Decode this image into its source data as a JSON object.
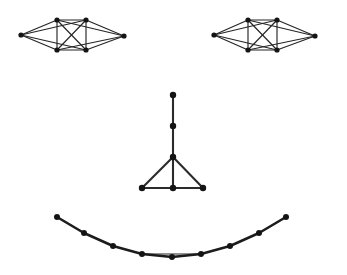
{
  "figure": {
    "background_color": "#ffffff",
    "width": 347,
    "height": 275,
    "edge_color": "#252525",
    "node_color": "#141414"
  },
  "components": [
    {
      "id": "left-eye",
      "name": "left-eye-graph",
      "description": "Six-node dense eye-shaped graph (left)",
      "node_radius": 2.6,
      "edge_width": 1.15,
      "nodes": [
        {
          "id": "L0",
          "label": "left-apex",
          "x": 21,
          "y": 35
        },
        {
          "id": "L1",
          "label": "top-left",
          "x": 57,
          "y": 20
        },
        {
          "id": "L2",
          "label": "top-right",
          "x": 86,
          "y": 20
        },
        {
          "id": "L3",
          "label": "right-apex",
          "x": 124,
          "y": 36
        },
        {
          "id": "L4",
          "label": "bottom-right",
          "x": 86,
          "y": 50
        },
        {
          "id": "L5",
          "label": "bottom-left",
          "x": 57,
          "y": 50
        }
      ],
      "edges": [
        [
          "L0",
          "L1"
        ],
        [
          "L0",
          "L2"
        ],
        [
          "L0",
          "L4"
        ],
        [
          "L0",
          "L5"
        ],
        [
          "L1",
          "L2"
        ],
        [
          "L1",
          "L3"
        ],
        [
          "L1",
          "L4"
        ],
        [
          "L1",
          "L5"
        ],
        [
          "L2",
          "L3"
        ],
        [
          "L2",
          "L4"
        ],
        [
          "L2",
          "L5"
        ],
        [
          "L3",
          "L4"
        ],
        [
          "L3",
          "L5"
        ],
        [
          "L4",
          "L5"
        ]
      ]
    },
    {
      "id": "right-eye",
      "name": "right-eye-graph",
      "description": "Six-node dense eye-shaped graph (right)",
      "node_radius": 2.6,
      "edge_width": 1.15,
      "nodes": [
        {
          "id": "R0",
          "label": "left-apex",
          "x": 214,
          "y": 35
        },
        {
          "id": "R1",
          "label": "top-left",
          "x": 248,
          "y": 20
        },
        {
          "id": "R2",
          "label": "top-right",
          "x": 277,
          "y": 20
        },
        {
          "id": "R3",
          "label": "right-apex",
          "x": 315,
          "y": 36
        },
        {
          "id": "R4",
          "label": "bottom-right",
          "x": 277,
          "y": 50
        },
        {
          "id": "R5",
          "label": "bottom-left",
          "x": 248,
          "y": 50
        }
      ],
      "edges": [
        [
          "R0",
          "R1"
        ],
        [
          "R0",
          "R2"
        ],
        [
          "R0",
          "R4"
        ],
        [
          "R0",
          "R5"
        ],
        [
          "R1",
          "R2"
        ],
        [
          "R1",
          "R3"
        ],
        [
          "R1",
          "R4"
        ],
        [
          "R1",
          "R5"
        ],
        [
          "R2",
          "R3"
        ],
        [
          "R2",
          "R4"
        ],
        [
          "R2",
          "R5"
        ],
        [
          "R3",
          "R4"
        ],
        [
          "R3",
          "R5"
        ],
        [
          "R4",
          "R5"
        ]
      ]
    },
    {
      "id": "nose",
      "name": "nose-graph",
      "description": "Six-node nose graph: vertical stem over a triangle",
      "node_radius": 3.2,
      "edge_width": 2.1,
      "nodes": [
        {
          "id": "N0",
          "label": "stem-top",
          "x": 173,
          "y": 95
        },
        {
          "id": "N1",
          "label": "stem-middle",
          "x": 173,
          "y": 126
        },
        {
          "id": "N2",
          "label": "triangle-apex",
          "x": 173,
          "y": 157
        },
        {
          "id": "N3",
          "label": "triangle-bottom-left",
          "x": 142,
          "y": 188
        },
        {
          "id": "N4",
          "label": "triangle-bottom-center",
          "x": 173,
          "y": 188
        },
        {
          "id": "N5",
          "label": "triangle-bottom-right",
          "x": 203,
          "y": 188
        }
      ],
      "edges": [
        [
          "N0",
          "N1"
        ],
        [
          "N1",
          "N2"
        ],
        [
          "N2",
          "N3"
        ],
        [
          "N2",
          "N4"
        ],
        [
          "N2",
          "N5"
        ],
        [
          "N3",
          "N4"
        ],
        [
          "N4",
          "N5"
        ]
      ]
    },
    {
      "id": "mouth",
      "name": "mouth-path-graph",
      "description": "Nine-node smile path curving downward",
      "node_radius": 3.0,
      "edge_width": 2.6,
      "nodes": [
        {
          "id": "M0",
          "label": "mouth-left-end",
          "x": 57,
          "y": 217
        },
        {
          "id": "M1",
          "label": "mouth-left-2",
          "x": 84,
          "y": 233
        },
        {
          "id": "M2",
          "label": "mouth-left-3",
          "x": 113,
          "y": 246
        },
        {
          "id": "M3",
          "label": "mouth-left-4",
          "x": 142,
          "y": 254
        },
        {
          "id": "M4",
          "label": "mouth-center",
          "x": 172,
          "y": 257
        },
        {
          "id": "M5",
          "label": "mouth-right-4",
          "x": 201,
          "y": 254
        },
        {
          "id": "M6",
          "label": "mouth-right-3",
          "x": 230,
          "y": 246
        },
        {
          "id": "M7",
          "label": "mouth-right-2",
          "x": 259,
          "y": 233
        },
        {
          "id": "M8",
          "label": "mouth-right-end",
          "x": 286,
          "y": 217
        }
      ],
      "edges": [
        [
          "M0",
          "M1"
        ],
        [
          "M1",
          "M2"
        ],
        [
          "M2",
          "M3"
        ],
        [
          "M3",
          "M4"
        ],
        [
          "M4",
          "M5"
        ],
        [
          "M5",
          "M6"
        ],
        [
          "M6",
          "M7"
        ],
        [
          "M7",
          "M8"
        ]
      ],
      "chord_edges": [
        [
          "M3",
          "M5"
        ]
      ]
    }
  ]
}
